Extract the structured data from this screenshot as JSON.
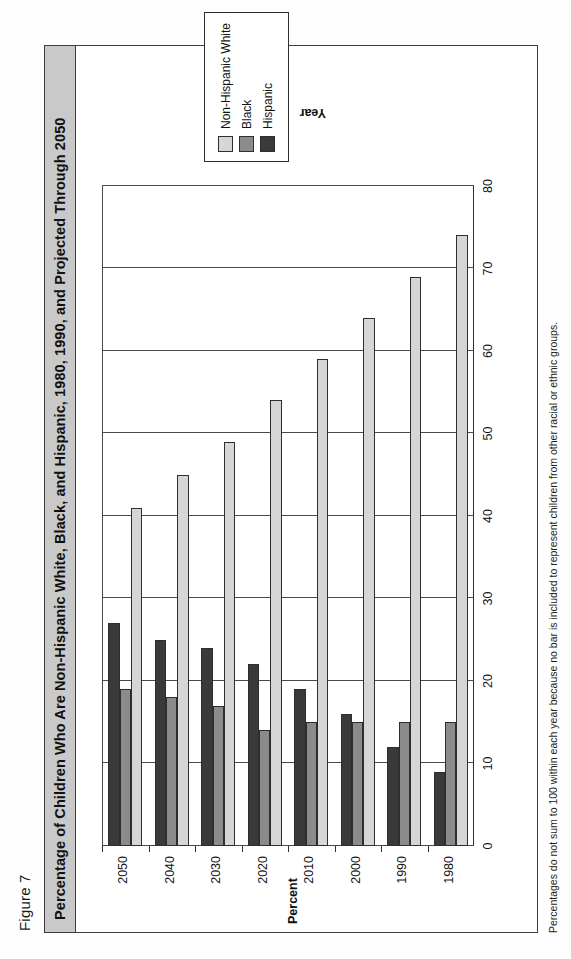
{
  "figure": {
    "label": "Figure 7",
    "title": "Percentage of Children Who Are Non-Hispanic White, Black, and Hispanic, 1980, 1990, and Projected Through 2050",
    "footnote": "Percentages do not sum to 100 within each year because no bar is included to represent children from other racial or ethnic groups."
  },
  "colors": {
    "non_hispanic_white": "#d6d6d6",
    "black": "#8b8b8b",
    "hispanic": "#3a3a3a",
    "axis": "#2e2e2e",
    "title_bar": "#c9c9c9"
  },
  "legend": {
    "items": [
      {
        "label": "Non-Hispanic White",
        "color": "#d6d6d6"
      },
      {
        "label": "Black",
        "color": "#8b8b8b"
      },
      {
        "label": "Hispanic",
        "color": "#3a3a3a"
      }
    ]
  },
  "chart_data": {
    "type": "bar",
    "orientation": "horizontal",
    "title": "Percentage of Children Who Are Non-Hispanic White, Black, and Hispanic, 1980, 1990, and Projected Through 2050",
    "xlabel": "Year",
    "ylabel": "Percent",
    "categories": [
      "1980",
      "1990",
      "2000",
      "2010",
      "2020",
      "2030",
      "2040",
      "2050"
    ],
    "ylim": [
      0,
      80
    ],
    "yticks": [
      0,
      10,
      20,
      30,
      40,
      50,
      60,
      70,
      80
    ],
    "grid": true,
    "legend_position": "right",
    "series": [
      {
        "name": "Non-Hispanic White",
        "color": "#d6d6d6",
        "values": [
          74,
          69,
          64,
          59,
          54,
          49,
          45,
          41
        ]
      },
      {
        "name": "Black",
        "color": "#8b8b8b",
        "values": [
          15,
          15,
          15,
          15,
          14,
          17,
          18,
          19
        ]
      },
      {
        "name": "Hispanic",
        "color": "#3a3a3a",
        "values": [
          9,
          12,
          16,
          19,
          22,
          24,
          25,
          27
        ]
      }
    ]
  }
}
